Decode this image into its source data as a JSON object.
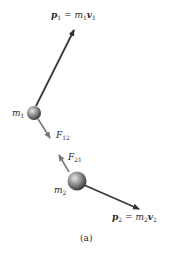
{
  "figure": {
    "caption": "(a)",
    "labels": {
      "p1": {
        "sym": "p",
        "sub": "1",
        "eq": "=",
        "m": "m",
        "msub": "1",
        "v": "v",
        "vsub": "1"
      },
      "p2": {
        "sym": "p",
        "sub": "2",
        "eq": "=",
        "m": "m",
        "msub": "2",
        "v": "v",
        "vsub": "2"
      },
      "m1": {
        "sym": "m",
        "sub": "1"
      },
      "m2": {
        "sym": "m",
        "sub": "2"
      },
      "F12": {
        "sym": "F",
        "sub": "12"
      },
      "F21": {
        "sym": "F",
        "sub": "21"
      }
    },
    "colors": {
      "momentum_arrow": "#3a3a3a",
      "force_arrow": "#7a7a7a",
      "ball_light": "#d8d8d8",
      "ball_dark": "#4a4a4a",
      "text": "#2a2a2a"
    }
  }
}
